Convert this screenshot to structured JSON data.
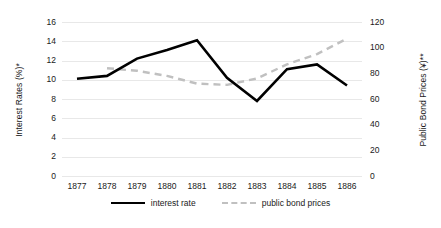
{
  "chart_data": {
    "type": "line",
    "title": "",
    "xlabel": "",
    "ylabel": "Interest Rates (%)*",
    "y2label": "Public Bond Prices (¥)**",
    "categories": [
      "1877",
      "1878",
      "1879",
      "1880",
      "1881",
      "1882",
      "1883",
      "1884",
      "1885",
      "1886"
    ],
    "ylim": [
      0,
      16
    ],
    "y2lim": [
      0,
      120
    ],
    "yticks": [
      "0",
      "2",
      "4",
      "6",
      "8",
      "10",
      "12",
      "14",
      "16"
    ],
    "y2ticks": [
      "0",
      "20",
      "40",
      "60",
      "80",
      "100",
      "120"
    ],
    "grid": true,
    "legend_position": "bottom",
    "series": [
      {
        "name": "interest rate",
        "axis": "left",
        "style": "solid",
        "color": "#000000",
        "values": [
          10.1,
          10.4,
          12.2,
          13.1,
          14.1,
          10.2,
          7.8,
          11.1,
          11.6,
          9.4
        ]
      },
      {
        "name": "public bond prices",
        "axis": "right",
        "style": "dashed",
        "color": "#c0c0c0",
        "values": [
          null,
          84,
          82,
          78,
          72,
          71,
          76,
          87,
          95,
          107
        ]
      }
    ]
  },
  "legend": {
    "items": [
      {
        "label": "interest rate"
      },
      {
        "label": "public bond prices"
      }
    ]
  },
  "colors": {
    "interest_rate": "#000000",
    "public_bond_prices": "#c0c0c0",
    "gridline": "#e8e8e8",
    "background": "#ffffff",
    "text": "#1a1a1a"
  }
}
